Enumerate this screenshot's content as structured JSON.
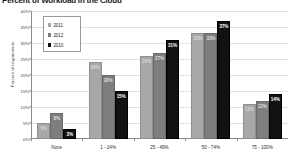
{
  "chart_data": {
    "type": "bar",
    "title": "Percent of Workload in the Cloud",
    "xlabel": "",
    "ylabel": "Percent of respondents",
    "categories": [
      "None",
      "1 - 24%",
      "25 - 49%",
      "50 - 74%",
      "75 - 100%"
    ],
    "series": [
      {
        "name": "2011",
        "color": "#a8a8a8",
        "values": [
          5,
          24,
          26,
          33,
          11
        ],
        "labels": [
          "5%",
          "24%",
          "26%",
          "33%",
          "11%"
        ]
      },
      {
        "name": "2012",
        "color": "#7e7e7e",
        "values": [
          8,
          20,
          27,
          33,
          12
        ],
        "labels": [
          "8%",
          "20%",
          "27%",
          "33%",
          "12%"
        ]
      },
      {
        "name": "2010",
        "color": "#111111",
        "values": [
          3,
          15,
          31,
          37,
          14
        ],
        "labels": [
          "3%",
          "15%",
          "31%",
          "37%",
          "14%"
        ]
      }
    ],
    "ylim": [
      0,
      40
    ],
    "y_ticks": [
      0,
      5,
      10,
      15,
      20,
      25,
      30,
      35,
      40
    ],
    "y_tick_labels": [
      "0%",
      "5%",
      "10%",
      "15%",
      "20%",
      "25%",
      "30%",
      "35%",
      "40%"
    ],
    "grid": true,
    "legend_position": "upper-left",
    "legend_entries": [
      "2011",
      "2012",
      "2010"
    ]
  }
}
